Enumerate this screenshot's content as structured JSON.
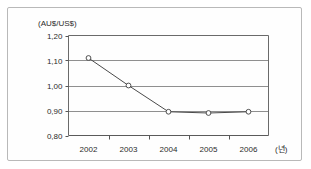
{
  "chart_data": {
    "type": "line",
    "title": "",
    "subtitle": "",
    "ylabel": "(AU$/US$)",
    "xlabel": "(년)",
    "categories": [
      "2002",
      "2003",
      "2004",
      "2005",
      "2006"
    ],
    "values": [
      1.11,
      1.0,
      0.895,
      0.89,
      0.895
    ],
    "series": [
      {
        "name": "AU$/US$ exchange rate",
        "values": [
          1.11,
          1.0,
          0.895,
          0.89,
          0.895
        ]
      }
    ],
    "ylim": [
      0.8,
      1.2
    ],
    "yticks": [
      0.8,
      0.9,
      1.0,
      1.1,
      1.2
    ],
    "ytick_labels": [
      "0,80",
      "0,90",
      "1,00",
      "1,10",
      "1,20"
    ],
    "xtick_labels": [
      "2002",
      "2003",
      "2004",
      "2005",
      "2006"
    ],
    "grid": "horizontal",
    "legend": "none",
    "marker": "open-circle",
    "line_color": "#4a4a4a",
    "grid_color": "#8f8f8f",
    "axis_color": "#555555",
    "marker_fill": "#ffffff",
    "marker_edge": "#3d3d3d",
    "frame_color": "#b9b9b9"
  }
}
